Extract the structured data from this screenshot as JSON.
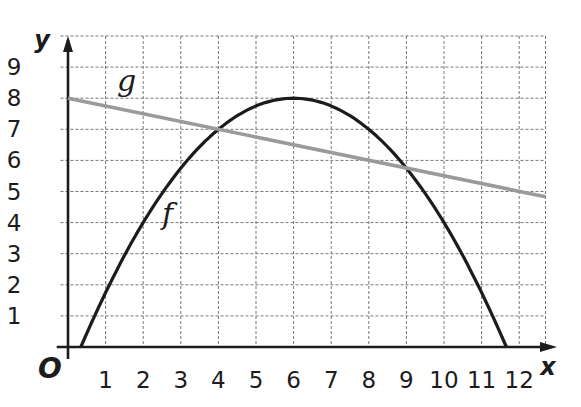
{
  "chart_data": {
    "type": "line",
    "title": "",
    "xlabel": "x",
    "ylabel": "y",
    "origin_label": "O",
    "xlim": [
      -0.2,
      12.7
    ],
    "ylim": [
      0,
      10
    ],
    "x_ticks": [
      1,
      2,
      3,
      4,
      5,
      6,
      7,
      8,
      9,
      10,
      11,
      12
    ],
    "y_ticks": [
      1,
      2,
      3,
      4,
      5,
      6,
      7,
      8,
      9
    ],
    "grid": true,
    "grid_style": "dashed",
    "legend": "none (curves labeled inline)",
    "series": [
      {
        "name": "f",
        "kind": "parabola",
        "formula": "f(x) = 8 - (x-6)^2/4",
        "vertex": [
          6,
          8
        ],
        "roots": [
          0.34,
          11.66
        ],
        "color": "#1c1c1c",
        "x": [
          0.34,
          1,
          2,
          3,
          4,
          5,
          6,
          7,
          8,
          9,
          10,
          11,
          11.66
        ],
        "values": [
          0,
          1.75,
          4,
          5.75,
          7,
          7.75,
          8,
          7.75,
          7,
          5.75,
          4,
          1.75,
          0
        ],
        "label_position": [
          2.5,
          4.2
        ]
      },
      {
        "name": "g",
        "kind": "line",
        "formula": "g(x) = 8 - x/4",
        "color": "#9a9a9a",
        "x": [
          0,
          4,
          9,
          12.7
        ],
        "values": [
          8,
          7,
          5.75,
          4.83
        ],
        "label_position": [
          1.3,
          8.5
        ]
      }
    ],
    "intersections": [
      [
        4,
        7
      ],
      [
        9,
        5.75
      ]
    ]
  }
}
